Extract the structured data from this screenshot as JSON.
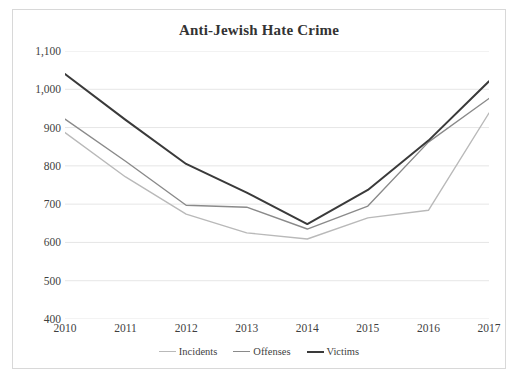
{
  "chart_data": {
    "type": "line",
    "title": "Anti-Jewish Hate Crime",
    "xlabel": "",
    "ylabel": "",
    "categories": [
      "2010",
      "2011",
      "2012",
      "2013",
      "2014",
      "2015",
      "2016",
      "2017"
    ],
    "x": [
      2010,
      2011,
      2012,
      2013,
      2014,
      2015,
      2016,
      2017
    ],
    "ylim": [
      400,
      1100
    ],
    "yticks": [
      400,
      500,
      600,
      700,
      800,
      900,
      1000,
      1100
    ],
    "ytick_labels": [
      "400",
      "500",
      "600",
      "700",
      "800",
      "900",
      "1,000",
      "1,100"
    ],
    "grid": true,
    "legend_position": "bottom",
    "series": [
      {
        "name": "Incidents",
        "color": "#b9b9b9",
        "values": [
          887,
          771,
          674,
          625,
          609,
          664,
          684,
          938
        ]
      },
      {
        "name": "Offenses",
        "color": "#8a8a8a",
        "values": [
          922,
          812,
          697,
          692,
          635,
          695,
          862,
          976
        ]
      },
      {
        "name": "Victims",
        "color": "#3a3a3a",
        "values": [
          1040,
          920,
          805,
          730,
          648,
          737,
          866,
          1021
        ]
      }
    ]
  },
  "chart": {
    "title": "Anti-Jewish Hate Crime"
  },
  "legend": {
    "items": [
      {
        "label": "Incidents"
      },
      {
        "label": "Offenses"
      },
      {
        "label": "Victims"
      }
    ]
  }
}
